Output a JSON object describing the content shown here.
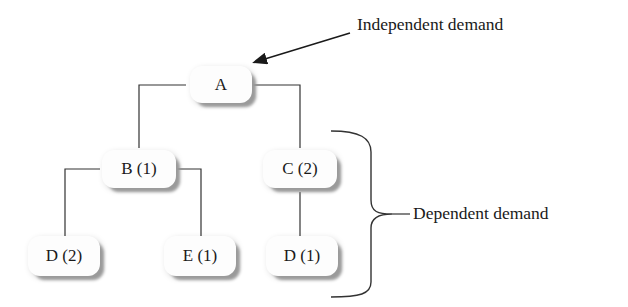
{
  "diagram": {
    "type": "product-structure-tree",
    "nodes": [
      {
        "id": "A",
        "label": "A",
        "level": 0
      },
      {
        "id": "B",
        "label": "B (1)",
        "level": 1,
        "parent": "A"
      },
      {
        "id": "C",
        "label": "C (2)",
        "level": 1,
        "parent": "A"
      },
      {
        "id": "D2",
        "label": "D (2)",
        "level": 2,
        "parent": "B"
      },
      {
        "id": "E",
        "label": "E (1)",
        "level": 2,
        "parent": "B"
      },
      {
        "id": "D1",
        "label": "D (1)",
        "level": 2,
        "parent": "C"
      }
    ],
    "annotations": {
      "independent": "Independent demand",
      "dependent": "Dependent demand"
    }
  }
}
